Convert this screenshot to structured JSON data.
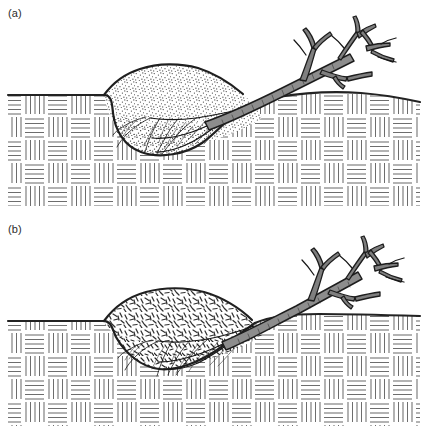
{
  "figure": {
    "background_color": "#ffffff",
    "width": 428,
    "height": 432,
    "line_color": "#232323",
    "hatch_color": "#6a6a6a",
    "panel_count": 2
  },
  "panels": [
    {
      "id": "panel-a",
      "label": "(a)",
      "caption_text": "(a)",
      "top": 0,
      "mound_texture": "stipple-dots",
      "mound_texture_label": "fine stipple (fine-grained soil)",
      "pit_shape": "rounded-bowl",
      "ground_level_y": 95,
      "mound_apex_y": 66,
      "pit_base_y": 152,
      "tree_present": true,
      "root_plate_present": true
    },
    {
      "id": "panel-b",
      "label": "(b)",
      "caption_text": "(b)",
      "top": 216,
      "mound_texture": "short-dashes",
      "mound_texture_label": "coarse clasts / gravel dashes",
      "pit_shape": "angular-v",
      "ground_level_y": 105,
      "mound_apex_y": 72,
      "pit_base_y": 152,
      "tree_present": true,
      "root_plate_present": true
    }
  ],
  "substrate": {
    "name": "bedrock-regolith",
    "pattern": "basket-weave-hatch",
    "cell_size_px": 23,
    "lines_per_cell": 5,
    "color": "#6a6a6a",
    "left_edge_x": 8,
    "right_edge_x": 420
  },
  "elements": {
    "tree_trunk": "fallen-tree-trunk",
    "branches": "tree-branches",
    "roots": "root-plate-roots",
    "mound": "ejected-soil-mound",
    "pit": "tree-throw-pit",
    "ground_surface": "ground-surface-line"
  }
}
